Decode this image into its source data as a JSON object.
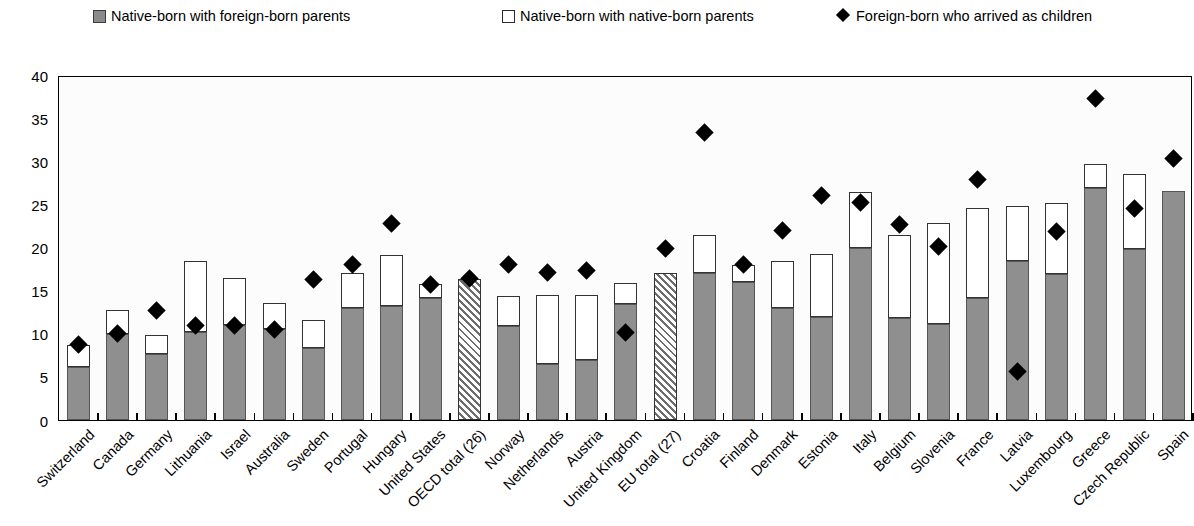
{
  "legend": {
    "items": [
      {
        "label": "Native-born with foreign-born parents",
        "marker": "grey-square-swatch",
        "color": "#8a8a8a"
      },
      {
        "label": "Native-born with native-born parents",
        "marker": "white-square-swatch",
        "color": "#ffffff"
      },
      {
        "label": "Foreign-born who arrived as children",
        "marker": "black-diamond-marker",
        "color": "#000000"
      }
    ]
  },
  "axis": {
    "y_ticks": [
      "0",
      "5",
      "10",
      "15",
      "20",
      "25",
      "30",
      "35",
      "40"
    ]
  },
  "chart_data": {
    "type": "bar",
    "subtype": "stacked-bar-with-scatter-overlay",
    "title": "",
    "xlabel": "",
    "ylabel": "",
    "ylim": [
      0,
      40
    ],
    "ytick_step": 5,
    "grid": false,
    "legend_position": "top",
    "categories": [
      "Switzerland",
      "Canada",
      "Germany",
      "Lithuania",
      "Israel",
      "Australia",
      "Sweden",
      "Portugal",
      "Hungary",
      "United States",
      "OECD total (26)",
      "Norway",
      "Netherlands",
      "Austria",
      "United Kingdom",
      "EU total (27)",
      "Croatia",
      "Finland",
      "Denmark",
      "Estonia",
      "Italy",
      "Belgium",
      "Slovenia",
      "France",
      "Latvia",
      "Luxembourg",
      "Greece",
      "Czech Republic",
      "Spain"
    ],
    "series": [
      {
        "name": "Native-born with foreign-born parents",
        "type": "bar-segment-bottom",
        "color": "#8f8f8f",
        "values": [
          6.2,
          10.0,
          7.6,
          10.2,
          11.0,
          10.5,
          8.4,
          13.0,
          13.2,
          14.2,
          16.4,
          10.9,
          6.5,
          7.0,
          13.5,
          17.1,
          17.0,
          16.0,
          13.0,
          12.0,
          19.9,
          11.8,
          11.1,
          14.2,
          18.4,
          16.9,
          26.9,
          19.8,
          26.6
        ]
      },
      {
        "name": "Native-born with native-born parents",
        "type": "bar-segment-top",
        "color": "#ffffff",
        "values": [
          2.5,
          2.7,
          2.3,
          8.2,
          5.5,
          3.1,
          3.2,
          4.1,
          5.9,
          1.6,
          0.0,
          3.5,
          8.0,
          7.5,
          2.4,
          0.0,
          4.4,
          2.0,
          5.4,
          7.3,
          6.5,
          9.6,
          11.7,
          10.4,
          6.4,
          8.3,
          2.8,
          8.7,
          0.0
        ]
      },
      {
        "name": "Bar totals (stacked)",
        "type": "bar-total",
        "values": [
          8.7,
          12.7,
          9.9,
          18.4,
          16.5,
          13.6,
          11.6,
          17.1,
          19.1,
          15.8,
          16.4,
          14.4,
          14.5,
          14.5,
          15.9,
          17.1,
          21.4,
          18.0,
          18.4,
          19.3,
          26.4,
          21.4,
          22.8,
          24.6,
          24.8,
          25.2,
          29.7,
          28.5,
          26.6
        ]
      },
      {
        "name": "Foreign-born who arrived as children",
        "type": "scatter-diamond",
        "color": "#000000",
        "values": [
          8.7,
          10.0,
          12.7,
          11.0,
          11.0,
          10.5,
          16.3,
          18.0,
          22.8,
          15.7,
          16.4,
          18.0,
          17.1,
          17.3,
          10.1,
          19.9,
          33.3,
          18.0,
          22.0,
          26.0,
          25.2,
          22.7,
          20.1,
          27.9,
          5.6,
          21.9,
          37.3,
          24.5,
          30.3
        ]
      }
    ],
    "special_bars": [
      {
        "category": "OECD total (26)",
        "style": "diagonal-hatch"
      },
      {
        "category": "EU total (27)",
        "style": "diagonal-hatch"
      }
    ]
  }
}
